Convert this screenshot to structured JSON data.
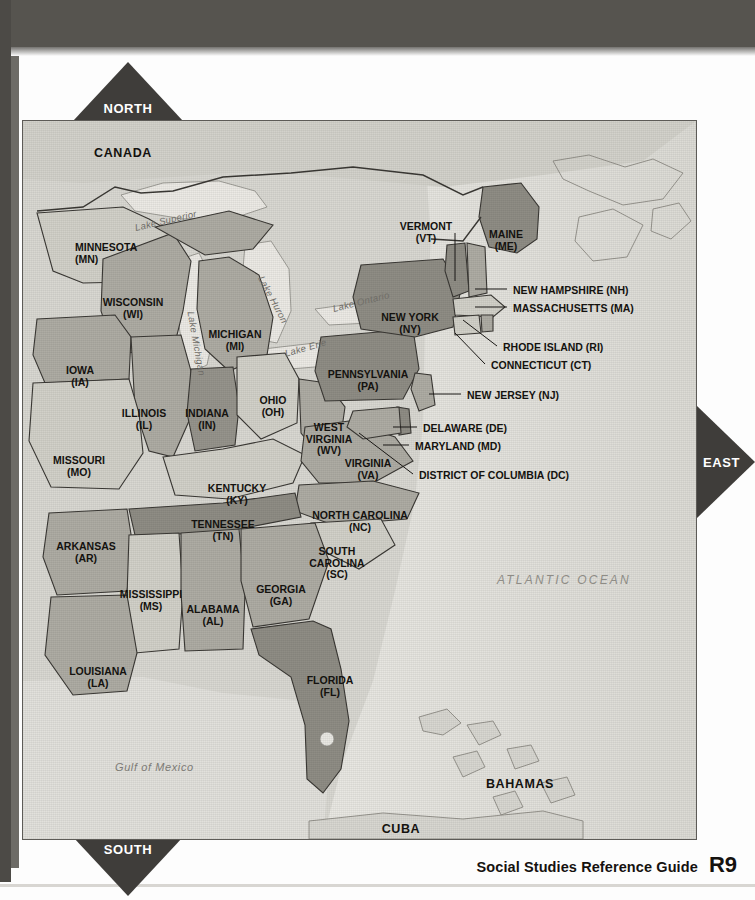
{
  "page": {
    "footer_label": "Social Studies Reference Guide",
    "footer_page": "R9"
  },
  "compass": {
    "north": "NORTH",
    "south": "SOUTH",
    "east": "EAST"
  },
  "map": {
    "title": "Eastern United States",
    "colors": {
      "land": "#c9c8c1",
      "state_light": "#d2d1c9",
      "state_medium": "#b0aea6",
      "state_dark": "#95938b",
      "water": "#e6e5e0",
      "ocean": "#dcdbd5",
      "border": "#3a3834",
      "frame": "#5d5b57",
      "arrow": "#3f3d3a",
      "page_band": "#56544f"
    },
    "countries": [
      {
        "name": "CANADA",
        "x": 100,
        "y": 27
      },
      {
        "name": "BAHAMAS",
        "x": 497,
        "y": 658
      },
      {
        "name": "CUBA",
        "x": 378,
        "y": 703
      }
    ],
    "oceans": [
      {
        "name": "ATLANTIC OCEAN",
        "x": 474,
        "y": 452
      }
    ],
    "gulfs": [
      {
        "name": "Gulf of Mexico",
        "x": 92,
        "y": 640
      }
    ],
    "lakes": [
      {
        "name": "Lake Superior",
        "x": 112,
        "y": 101,
        "rotate": -13
      },
      {
        "name": "Lake Michigan",
        "x": 168,
        "y": 185,
        "rotate": 80
      },
      {
        "name": "Lake Huron",
        "x": 238,
        "y": 150,
        "rotate": 62
      },
      {
        "name": "Lake Erie",
        "x": 262,
        "y": 227,
        "rotate": -16
      },
      {
        "name": "Lake Ontario",
        "x": 310,
        "y": 182,
        "rotate": -14
      }
    ],
    "states_inline": [
      {
        "abbr": "MN",
        "name": "MINNESOTA",
        "x": 52,
        "y": 121,
        "align": "l"
      },
      {
        "abbr": "WI",
        "name": "WISCONSIN",
        "x": 110,
        "y": 176,
        "align": "c"
      },
      {
        "abbr": "MI",
        "name": "MICHIGAN",
        "x": 212,
        "y": 208,
        "align": "c"
      },
      {
        "abbr": "IA",
        "name": "IOWA",
        "x": 57,
        "y": 244,
        "align": "c"
      },
      {
        "abbr": "IL",
        "name": "ILLINOIS",
        "x": 121,
        "y": 287,
        "align": "c"
      },
      {
        "abbr": "IN",
        "name": "INDIANA",
        "x": 184,
        "y": 287,
        "align": "c"
      },
      {
        "abbr": "OH",
        "name": "OHIO",
        "x": 250,
        "y": 274,
        "align": "c"
      },
      {
        "abbr": "MO",
        "name": "MISSOURI",
        "x": 56,
        "y": 334,
        "align": "c"
      },
      {
        "abbr": "KY",
        "name": "KENTUCKY",
        "x": 214,
        "y": 362,
        "align": "c"
      },
      {
        "abbr": "AR",
        "name": "ARKANSAS",
        "x": 63,
        "y": 420,
        "align": "c"
      },
      {
        "abbr": "TN",
        "name": "TENNESSEE",
        "x": 200,
        "y": 398,
        "align": "c"
      },
      {
        "abbr": "MS",
        "name": "MISSISSIPPI",
        "x": 128,
        "y": 468,
        "align": "c"
      },
      {
        "abbr": "AL",
        "name": "ALABAMA",
        "x": 190,
        "y": 483,
        "align": "c"
      },
      {
        "abbr": "GA",
        "name": "GEORGIA",
        "x": 258,
        "y": 463,
        "align": "c"
      },
      {
        "abbr": "LA",
        "name": "LOUISIANA",
        "x": 75,
        "y": 545,
        "align": "c"
      },
      {
        "abbr": "FL",
        "name": "FLORIDA",
        "x": 307,
        "y": 554,
        "align": "c"
      },
      {
        "abbr": "SC",
        "name": "SOUTH\nCAROLINA",
        "x": 314,
        "y": 425,
        "align": "c"
      },
      {
        "abbr": "NC",
        "name": "NORTH CAROLINA",
        "x": 337,
        "y": 389,
        "align": "c"
      },
      {
        "abbr": "VA",
        "name": "VIRGINIA",
        "x": 345,
        "y": 337,
        "align": "c"
      },
      {
        "abbr": "WV",
        "name": "WEST\nVIRGINIA",
        "x": 306,
        "y": 301,
        "align": "c"
      },
      {
        "abbr": "PA",
        "name": "PENNSYLVANIA",
        "x": 345,
        "y": 248,
        "align": "c"
      },
      {
        "abbr": "NY",
        "name": "NEW YORK",
        "x": 387,
        "y": 191,
        "align": "c"
      },
      {
        "abbr": "ME",
        "name": "MAINE",
        "x": 483,
        "y": 108,
        "align": "c"
      },
      {
        "abbr": "VT",
        "name": "VERMONT",
        "x": 403,
        "y": 100,
        "align": "c"
      }
    ],
    "callouts": [
      {
        "abbr": "NH",
        "label": "NEW HAMPSHIRE (NH)",
        "x": 490,
        "y": 164,
        "lx1": 452,
        "ly1": 168,
        "lx2": 484,
        "ly2": 168
      },
      {
        "abbr": "MA",
        "label": "MASSACHUSETTS (MA)",
        "x": 490,
        "y": 182,
        "lx1": 452,
        "ly1": 186,
        "lx2": 484,
        "ly2": 186
      },
      {
        "abbr": "RI",
        "label": "RHODE ISLAND (RI)",
        "x": 480,
        "y": 221,
        "lx1": 440,
        "ly1": 199,
        "lx2": 474,
        "ly2": 225,
        "diag": true
      },
      {
        "abbr": "CT",
        "label": "CONNECTICUT (CT)",
        "x": 468,
        "y": 239,
        "lx1": 432,
        "ly1": 212,
        "lx2": 462,
        "ly2": 243,
        "diag": true
      },
      {
        "abbr": "NJ",
        "label": "NEW JERSEY (NJ)",
        "x": 444,
        "y": 269,
        "lx1": 406,
        "ly1": 273,
        "lx2": 438,
        "ly2": 273
      },
      {
        "abbr": "DE",
        "label": "DELAWARE (DE)",
        "x": 400,
        "y": 302,
        "lx1": 370,
        "ly1": 306,
        "lx2": 394,
        "ly2": 306
      },
      {
        "abbr": "MD",
        "label": "MARYLAND (MD)",
        "x": 392,
        "y": 320,
        "lx1": 360,
        "ly1": 324,
        "lx2": 386,
        "ly2": 324
      },
      {
        "abbr": "DC",
        "label": "DISTRICT OF COLUMBIA (DC)",
        "x": 396,
        "y": 349,
        "lx1": 336,
        "ly1": 312,
        "lx2": 390,
        "ly2": 353,
        "diag": true
      }
    ]
  }
}
